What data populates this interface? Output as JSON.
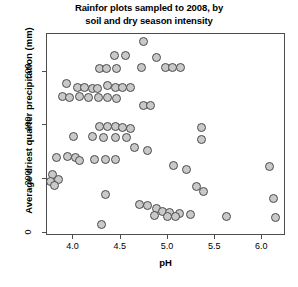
{
  "chart_data": {
    "type": "scatter",
    "title": "Rainfor plots sampled to 2008, by\nsoil and dry season intensity",
    "xlabel": "pH",
    "ylabel": "Average driest quarter precipitation (mm)",
    "xlim": [
      3.72,
      6.25
    ],
    "ylim": [
      -12,
      740
    ],
    "xticks": [
      4.0,
      4.5,
      5.0,
      5.5,
      6.0
    ],
    "xticklabels": [
      "4.0",
      "4.5",
      "5.0",
      "5.5",
      "6.0"
    ],
    "yticks": [
      0,
      200,
      400,
      600
    ],
    "yticklabels": [
      "0",
      "200",
      "400",
      "600"
    ],
    "grid": false,
    "legend": null,
    "marker": {
      "shape": "circle",
      "fill_color": "#c9c9c9",
      "edge_color": "#4a4a4a",
      "size_px": 9
    },
    "points": [
      {
        "x": 4.74,
        "y": 712
      },
      {
        "x": 4.43,
        "y": 660
      },
      {
        "x": 4.55,
        "y": 660
      },
      {
        "x": 4.88,
        "y": 652
      },
      {
        "x": 4.28,
        "y": 612
      },
      {
        "x": 4.35,
        "y": 612
      },
      {
        "x": 4.46,
        "y": 612
      },
      {
        "x": 4.72,
        "y": 616
      },
      {
        "x": 4.97,
        "y": 616
      },
      {
        "x": 5.05,
        "y": 616
      },
      {
        "x": 5.13,
        "y": 616
      },
      {
        "x": 3.93,
        "y": 556
      },
      {
        "x": 4.04,
        "y": 540
      },
      {
        "x": 4.12,
        "y": 540
      },
      {
        "x": 4.2,
        "y": 536
      },
      {
        "x": 4.25,
        "y": 536
      },
      {
        "x": 4.36,
        "y": 548
      },
      {
        "x": 4.44,
        "y": 540
      },
      {
        "x": 4.52,
        "y": 540
      },
      {
        "x": 4.6,
        "y": 540
      },
      {
        "x": 3.88,
        "y": 508
      },
      {
        "x": 3.96,
        "y": 504
      },
      {
        "x": 4.06,
        "y": 508
      },
      {
        "x": 4.16,
        "y": 504
      },
      {
        "x": 4.26,
        "y": 504
      },
      {
        "x": 4.36,
        "y": 504
      },
      {
        "x": 4.46,
        "y": 500
      },
      {
        "x": 4.74,
        "y": 472
      },
      {
        "x": 4.82,
        "y": 472
      },
      {
        "x": 4.28,
        "y": 396
      },
      {
        "x": 4.36,
        "y": 396
      },
      {
        "x": 4.44,
        "y": 396
      },
      {
        "x": 4.52,
        "y": 392
      },
      {
        "x": 4.6,
        "y": 388
      },
      {
        "x": 5.36,
        "y": 392
      },
      {
        "x": 4.0,
        "y": 360
      },
      {
        "x": 4.2,
        "y": 360
      },
      {
        "x": 4.32,
        "y": 356
      },
      {
        "x": 4.44,
        "y": 356
      },
      {
        "x": 4.56,
        "y": 356
      },
      {
        "x": 5.36,
        "y": 348
      },
      {
        "x": 4.65,
        "y": 316
      },
      {
        "x": 4.78,
        "y": 308
      },
      {
        "x": 3.82,
        "y": 280
      },
      {
        "x": 3.94,
        "y": 284
      },
      {
        "x": 4.02,
        "y": 280
      },
      {
        "x": 4.06,
        "y": 268
      },
      {
        "x": 4.22,
        "y": 272
      },
      {
        "x": 4.34,
        "y": 272
      },
      {
        "x": 4.44,
        "y": 272
      },
      {
        "x": 5.06,
        "y": 252
      },
      {
        "x": 5.2,
        "y": 236
      },
      {
        "x": 6.08,
        "y": 248
      },
      {
        "x": 3.78,
        "y": 216
      },
      {
        "x": 3.84,
        "y": 200
      },
      {
        "x": 3.76,
        "y": 192
      },
      {
        "x": 3.8,
        "y": 176
      },
      {
        "x": 5.3,
        "y": 172
      },
      {
        "x": 5.38,
        "y": 152
      },
      {
        "x": 4.34,
        "y": 144
      },
      {
        "x": 6.12,
        "y": 128
      },
      {
        "x": 4.7,
        "y": 104
      },
      {
        "x": 4.78,
        "y": 100
      },
      {
        "x": 4.88,
        "y": 92
      },
      {
        "x": 4.94,
        "y": 80
      },
      {
        "x": 5.02,
        "y": 76
      },
      {
        "x": 5.12,
        "y": 72
      },
      {
        "x": 4.86,
        "y": 64
      },
      {
        "x": 5.0,
        "y": 60
      },
      {
        "x": 5.08,
        "y": 60
      },
      {
        "x": 5.24,
        "y": 68
      },
      {
        "x": 5.62,
        "y": 60
      },
      {
        "x": 6.14,
        "y": 56
      },
      {
        "x": 4.3,
        "y": 32
      }
    ]
  }
}
